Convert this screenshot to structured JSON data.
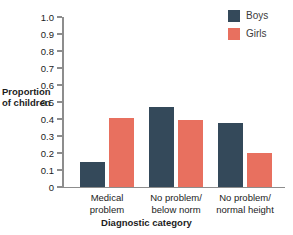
{
  "chart_data": {
    "type": "bar",
    "title": "",
    "xlabel": "Diagnostic category",
    "ylabel": "Proportion\nof children",
    "ylabel_line1": "Proportion",
    "ylabel_line2": "of children",
    "categories": [
      "Medical\nproblem",
      "No problem/\nbelow norm",
      "No problem/\nnormal height"
    ],
    "series": [
      {
        "name": "Boys",
        "color": "#34495a",
        "values": [
          0.15,
          0.47,
          0.375
        ]
      },
      {
        "name": "Girls",
        "color": "#e8705f",
        "values": [
          0.405,
          0.395,
          0.2
        ]
      }
    ],
    "ylim": [
      0,
      1.0
    ],
    "yticks": [
      0,
      0.1,
      0.2,
      0.3,
      0.4,
      0.5,
      0.6,
      0.7,
      0.8,
      0.9,
      1.0
    ],
    "ytick_labels": [
      "0",
      "0.1",
      "0.2",
      "0.3",
      "0.4",
      "0.5",
      "0.6",
      "0.7",
      "0.8",
      "0.9",
      "1.0"
    ],
    "grid": false,
    "legend_position": "top-right",
    "axis_color": "#8d8d8d"
  }
}
